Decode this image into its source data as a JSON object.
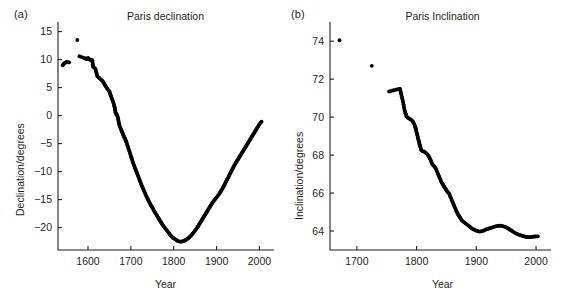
{
  "figure": {
    "background": "#ffffff",
    "ink_color": "#231f20",
    "marker_color": "#000000",
    "panels": [
      "a",
      "b"
    ]
  },
  "panel_a": {
    "label": "(a)",
    "title": "Paris declination",
    "xlabel": "Year",
    "ylabel": "Declination/degrees",
    "xticks": [
      "1600",
      "1700",
      "1800",
      "1900",
      "2000"
    ],
    "yticks": [
      "15",
      "10",
      "5",
      "0",
      "−5",
      "−10",
      "−15",
      "−20"
    ]
  },
  "panel_b": {
    "label": "(b)",
    "title": "Paris Inclination",
    "xlabel": "Year",
    "ylabel": "Inclination/degrees",
    "xticks": [
      "1700",
      "1800",
      "1900",
      "2000"
    ],
    "yticks": [
      "74",
      "72",
      "70",
      "68",
      "66",
      "64"
    ]
  },
  "chart_data": [
    {
      "type": "scatter",
      "panel": "a",
      "title": "Paris declination",
      "xlabel": "Year",
      "ylabel": "Declination/degrees",
      "xlim": [
        1530,
        2020
      ],
      "ylim": [
        -24,
        16
      ],
      "xticks": [
        1600,
        1700,
        1800,
        1900,
        2000
      ],
      "yticks": [
        15,
        10,
        5,
        0,
        -5,
        -10,
        -15,
        -20
      ],
      "grid": false,
      "legend": false,
      "marker": "dot",
      "series": [
        {
          "name": "Paris declination",
          "x": [
            1541,
            1544,
            1550,
            1556,
            1575,
            1580,
            1594,
            1598,
            1600,
            1603,
            1606,
            1610,
            1612,
            1617,
            1622,
            1634,
            1640,
            1645,
            1650,
            1655,
            1658,
            1660,
            1663,
            1664,
            1666,
            1667,
            1668,
            1670,
            1671,
            1672,
            1673,
            1675,
            1678,
            1680,
            1681,
            1683,
            1685,
            1687,
            1690,
            1692,
            1695,
            1698,
            1700,
            1703,
            1706,
            1710,
            1713,
            1716,
            1720,
            1723,
            1726,
            1730,
            1734,
            1738,
            1742,
            1746,
            1750,
            1754,
            1758,
            1762,
            1766,
            1770,
            1774,
            1778,
            1782,
            1786,
            1790,
            1794,
            1798,
            1802,
            1806,
            1810,
            1814,
            1818,
            1822,
            1826,
            1830,
            1834,
            1838,
            1842,
            1846,
            1850,
            1854,
            1858,
            1862,
            1866,
            1870,
            1874,
            1878,
            1882,
            1886,
            1890,
            1894,
            1898,
            1902,
            1906,
            1910,
            1914,
            1918,
            1922,
            1926,
            1930,
            1934,
            1938,
            1942,
            1946,
            1950,
            1954,
            1958,
            1962,
            1966,
            1970,
            1974,
            1978,
            1982,
            1986,
            1990,
            1994,
            1998,
            2002,
            2005
          ],
          "y": [
            9.0,
            9.3,
            9.6,
            9.5,
            13.5,
            10.6,
            10.2,
            10.1,
            10.3,
            10.0,
            10.0,
            9.9,
            8.7,
            8.4,
            7.0,
            6.2,
            5.4,
            4.8,
            4.3,
            3.2,
            2.6,
            2.1,
            1.2,
            0.6,
            0.3,
            0.2,
            0.1,
            -0.4,
            -0.9,
            -1.3,
            -1.6,
            -2.1,
            -2.6,
            -3.0,
            -3.2,
            -3.6,
            -3.9,
            -4.2,
            -4.8,
            -5.3,
            -6.0,
            -6.7,
            -7.2,
            -7.9,
            -8.6,
            -9.4,
            -10.0,
            -10.6,
            -11.4,
            -12.0,
            -12.6,
            -13.3,
            -14.0,
            -14.7,
            -15.3,
            -15.9,
            -16.4,
            -17.0,
            -17.5,
            -18.0,
            -18.5,
            -19.0,
            -19.5,
            -19.9,
            -20.3,
            -20.7,
            -21.1,
            -21.5,
            -21.8,
            -22.0,
            -22.2,
            -22.4,
            -22.5,
            -22.5,
            -22.4,
            -22.3,
            -22.1,
            -21.9,
            -21.6,
            -21.3,
            -20.9,
            -20.5,
            -20.1,
            -19.6,
            -19.1,
            -18.6,
            -18.1,
            -17.6,
            -17.1,
            -16.6,
            -16.1,
            -15.6,
            -15.2,
            -14.8,
            -14.4,
            -14.0,
            -13.5,
            -13.0,
            -12.4,
            -11.8,
            -11.2,
            -10.6,
            -10.0,
            -9.4,
            -8.8,
            -8.3,
            -7.8,
            -7.3,
            -6.8,
            -6.3,
            -5.8,
            -5.3,
            -4.8,
            -4.3,
            -3.8,
            -3.3,
            -2.8,
            -2.3,
            -1.8,
            -1.3,
            -1.1
          ]
        }
      ]
    },
    {
      "type": "scatter",
      "panel": "b",
      "title": "Paris Inclination",
      "xlabel": "Year",
      "ylabel": "Inclination/degrees",
      "xlim": [
        1655,
        2015
      ],
      "ylim": [
        63.0,
        74.8
      ],
      "xticks": [
        1700,
        1800,
        1900,
        2000
      ],
      "yticks": [
        74,
        72,
        70,
        68,
        66,
        64
      ],
      "grid": false,
      "legend": false,
      "marker": "dot",
      "series": [
        {
          "name": "Paris inclination",
          "x": [
            1671,
            1725,
            1754,
            1772,
            1777,
            1780,
            1783,
            1786,
            1789,
            1791,
            1793,
            1795,
            1797,
            1798,
            1799,
            1800,
            1802,
            1804,
            1806,
            1808,
            1810,
            1812,
            1814,
            1816,
            1818,
            1820,
            1822,
            1824,
            1826,
            1828,
            1830,
            1832,
            1834,
            1836,
            1838,
            1840,
            1842,
            1844,
            1846,
            1848,
            1850,
            1852,
            1854,
            1856,
            1858,
            1860,
            1862,
            1864,
            1866,
            1868,
            1870,
            1872,
            1874,
            1876,
            1878,
            1880,
            1882,
            1884,
            1886,
            1888,
            1890,
            1892,
            1894,
            1896,
            1898,
            1900,
            1902,
            1904,
            1906,
            1908,
            1910,
            1912,
            1914,
            1916,
            1918,
            1920,
            1922,
            1924,
            1926,
            1928,
            1930,
            1932,
            1934,
            1936,
            1938,
            1940,
            1942,
            1944,
            1946,
            1948,
            1950,
            1952,
            1954,
            1956,
            1958,
            1960,
            1962,
            1964,
            1966,
            1968,
            1970,
            1972,
            1974,
            1976,
            1978,
            1980,
            1982,
            1984,
            1986,
            1988,
            1990,
            1992,
            1994,
            1996,
            1998,
            2000,
            2003
          ],
          "y": [
            74.05,
            72.7,
            71.35,
            71.5,
            70.85,
            70.35,
            70.05,
            69.95,
            69.9,
            69.85,
            69.8,
            69.7,
            69.55,
            69.45,
            69.35,
            69.2,
            68.95,
            68.7,
            68.45,
            68.25,
            68.2,
            68.2,
            68.15,
            68.1,
            68.05,
            67.95,
            67.85,
            67.7,
            67.55,
            67.45,
            67.4,
            67.3,
            67.15,
            67.0,
            66.85,
            66.7,
            66.55,
            66.45,
            66.35,
            66.25,
            66.15,
            66.05,
            66.0,
            65.85,
            65.7,
            65.55,
            65.4,
            65.25,
            65.1,
            64.95,
            64.85,
            64.75,
            64.65,
            64.55,
            64.5,
            64.45,
            64.4,
            64.35,
            64.3,
            64.25,
            64.2,
            64.15,
            64.1,
            64.08,
            64.05,
            64.02,
            64.0,
            63.98,
            63.97,
            63.98,
            64.0,
            64.02,
            64.05,
            64.08,
            64.1,
            64.12,
            64.14,
            64.16,
            64.18,
            64.2,
            64.22,
            64.24,
            64.26,
            64.27,
            64.28,
            64.28,
            64.27,
            64.26,
            64.24,
            64.22,
            64.19,
            64.16,
            64.12,
            64.08,
            64.04,
            64.0,
            63.96,
            63.92,
            63.88,
            63.85,
            63.82,
            63.8,
            63.78,
            63.76,
            63.74,
            63.72,
            63.7,
            63.69,
            63.68,
            63.68,
            63.68,
            63.69,
            63.7,
            63.7,
            63.71,
            63.72,
            63.72
          ]
        }
      ]
    }
  ]
}
